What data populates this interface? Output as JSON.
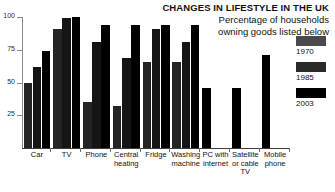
{
  "header": {
    "title": "CHANGES IN LIFESTYLE IN THE UK",
    "subtitle_line1": "Percentage of households",
    "subtitle_line2": "owning goods listed below"
  },
  "legend": {
    "entries": [
      {
        "label": "1970",
        "color": "#4a4a4a"
      },
      {
        "label": "1985",
        "color": "#2a2a2a"
      },
      {
        "label": "2003",
        "color": "#000000"
      }
    ]
  },
  "axis": {
    "yticks": [
      "100",
      "75",
      "50",
      "25"
    ]
  },
  "categories_display": [
    {
      "line1": "Car",
      "line2": "",
      "line3": ""
    },
    {
      "line1": "TV",
      "line2": "",
      "line3": ""
    },
    {
      "line1": "Phone",
      "line2": "",
      "line3": ""
    },
    {
      "line1": "Central",
      "line2": "heating",
      "line3": ""
    },
    {
      "line1": "Fridge",
      "line2": "",
      "line3": ""
    },
    {
      "line1": "Washing",
      "line2": "machine",
      "line3": ""
    },
    {
      "line1": "PC with",
      "line2": "internet",
      "line3": ""
    },
    {
      "line1": "Satellite",
      "line2": "or cable",
      "line3": "TV"
    },
    {
      "line1": "Mobile",
      "line2": "phone",
      "line3": ""
    }
  ],
  "chart_data": {
    "type": "bar",
    "title": "CHANGES IN LIFESTYLE IN THE UK",
    "subtitle": "Percentage of households owning goods listed below",
    "xlabel": "",
    "ylabel": "",
    "ylim": [
      0,
      100
    ],
    "yticks": [
      25,
      50,
      75,
      100
    ],
    "grid": false,
    "legend_position": "right",
    "categories": [
      "Car",
      "TV",
      "Phone",
      "Central heating",
      "Fridge",
      "Washing machine",
      "PC with internet",
      "Satellite or cable TV",
      "Mobile phone"
    ],
    "series": [
      {
        "name": "1970",
        "color": "#4a4a4a",
        "values": [
          50,
          91,
          35,
          32,
          66,
          66,
          null,
          null,
          null
        ]
      },
      {
        "name": "1985",
        "color": "#2a2a2a",
        "values": [
          62,
          99,
          81,
          69,
          91,
          81,
          null,
          null,
          null
        ]
      },
      {
        "name": "2003",
        "color": "#000000",
        "values": [
          74,
          100,
          94,
          94,
          94,
          94,
          46,
          46,
          71
        ]
      }
    ]
  }
}
